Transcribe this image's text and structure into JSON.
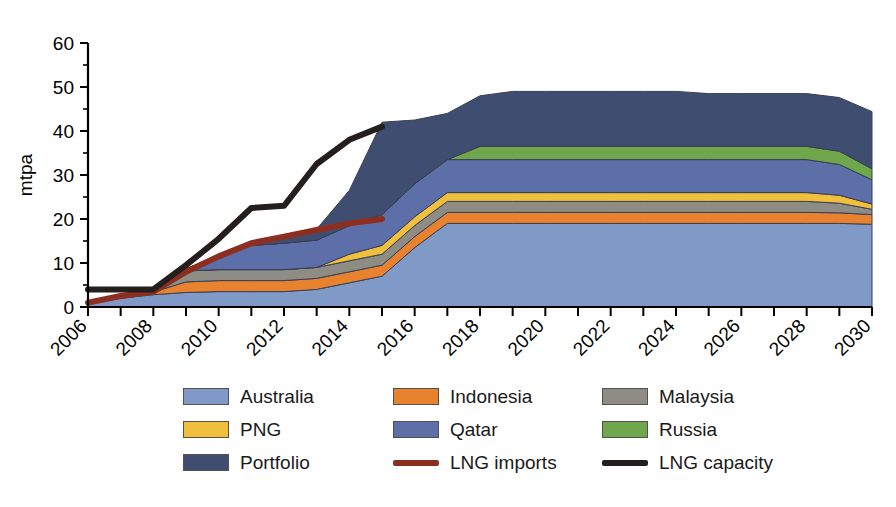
{
  "chart_data": {
    "type": "area",
    "title": "",
    "subtitle": "",
    "xlabel": "",
    "ylabel": "mtpa",
    "ylim": [
      0,
      60
    ],
    "xlim": [
      2006,
      2030
    ],
    "ytick_step": 10,
    "yticks": [
      "0",
      "10",
      "20",
      "30",
      "40",
      "50",
      "60"
    ],
    "xticks": [
      "2006",
      "2008",
      "2010",
      "2012",
      "2014",
      "2016",
      "2018",
      "2020",
      "2022",
      "2024",
      "2026",
      "2028",
      "2030"
    ],
    "xtick_step": 2,
    "minor_xticks_every": 1,
    "grid": false,
    "legend_position": "bottom",
    "stacked": true,
    "x": [
      2006,
      2007,
      2008,
      2009,
      2010,
      2011,
      2012,
      2013,
      2014,
      2015,
      2016,
      2017,
      2018,
      2019,
      2020,
      2021,
      2022,
      2023,
      2024,
      2025,
      2026,
      2027,
      2028,
      2029,
      2030
    ],
    "series": [
      {
        "name": "Australia",
        "color": "#7f9ac6",
        "type": "area",
        "values": [
          1.0,
          2.0,
          2.8,
          3.3,
          3.5,
          3.5,
          3.5,
          4.0,
          5.5,
          7.0,
          13.5,
          19.0,
          19.0,
          19.0,
          19.0,
          19.0,
          19.0,
          19.0,
          19.0,
          19.0,
          19.0,
          19.0,
          19.0,
          19.0,
          18.8
        ]
      },
      {
        "name": "Indonesia",
        "color": "#e8822f",
        "type": "area",
        "values": [
          0.0,
          0.3,
          0.6,
          2.4,
          2.5,
          2.5,
          2.5,
          2.5,
          2.5,
          2.5,
          2.5,
          2.5,
          2.5,
          2.5,
          2.5,
          2.5,
          2.5,
          2.5,
          2.5,
          2.5,
          2.5,
          2.5,
          2.5,
          2.4,
          2.2
        ]
      },
      {
        "name": "Malaysia",
        "color": "#8d8c85",
        "type": "area",
        "values": [
          0.0,
          0.0,
          0.3,
          2.5,
          2.5,
          2.5,
          2.5,
          2.5,
          2.5,
          2.5,
          2.5,
          2.5,
          2.5,
          2.5,
          2.5,
          2.5,
          2.5,
          2.5,
          2.5,
          2.5,
          2.5,
          2.5,
          2.5,
          2.2,
          1.2
        ]
      },
      {
        "name": "PNG",
        "color": "#f0c03d",
        "type": "area",
        "values": [
          0.0,
          0.0,
          0.0,
          0.0,
          0.0,
          0.0,
          0.0,
          0.0,
          1.5,
          2.0,
          2.0,
          2.0,
          2.0,
          2.0,
          2.0,
          2.0,
          2.0,
          2.0,
          2.0,
          2.0,
          2.0,
          2.0,
          2.0,
          1.8,
          1.2
        ]
      },
      {
        "name": "Qatar",
        "color": "#5c6fa8",
        "type": "area",
        "values": [
          0.0,
          0.0,
          0.0,
          0.5,
          3.0,
          5.5,
          6.0,
          6.2,
          6.5,
          7.0,
          7.5,
          7.5,
          7.5,
          7.5,
          7.5,
          7.5,
          7.5,
          7.5,
          7.5,
          7.5,
          7.5,
          7.5,
          7.5,
          7.0,
          5.5
        ]
      },
      {
        "name": "Russia",
        "color": "#6fa84c",
        "type": "area",
        "values": [
          0.0,
          0.0,
          0.0,
          0.0,
          0.0,
          0.0,
          0.0,
          0.0,
          0.0,
          0.0,
          0.0,
          0.0,
          3.0,
          3.0,
          3.0,
          3.0,
          3.0,
          3.0,
          3.0,
          3.0,
          3.0,
          3.0,
          3.0,
          3.0,
          2.5
        ]
      },
      {
        "name": "Portfolio",
        "color": "#3f4e70",
        "type": "area",
        "values": [
          0.0,
          0.0,
          0.0,
          0.0,
          0.0,
          0.5,
          1.5,
          2.5,
          8.0,
          21.0,
          14.5,
          10.5,
          11.5,
          12.5,
          12.5,
          12.5,
          12.5,
          12.5,
          12.5,
          12.0,
          12.0,
          12.0,
          12.0,
          12.2,
          13.0
        ]
      }
    ],
    "lines": [
      {
        "name": "LNG imports",
        "color": "#8c2f21",
        "type": "line",
        "x": [
          2006,
          2007,
          2008,
          2009,
          2010,
          2011,
          2012,
          2013,
          2014,
          2015
        ],
        "values": [
          1.0,
          2.5,
          3.5,
          8.0,
          11.5,
          14.5,
          16.0,
          17.5,
          19.0,
          20.0
        ]
      },
      {
        "name": "LNG capacity",
        "color": "#241f1c",
        "type": "line",
        "x": [
          2006,
          2007,
          2008,
          2009,
          2010,
          2011,
          2012,
          2013,
          2014,
          2015
        ],
        "values": [
          4.0,
          4.0,
          4.0,
          9.5,
          15.5,
          22.5,
          23.0,
          32.5,
          38.0,
          41.0
        ]
      }
    ]
  },
  "legend": {
    "entries": [
      {
        "label": "Australia",
        "color": "#7f9ac6",
        "marker": "swatch"
      },
      {
        "label": "Indonesia",
        "color": "#e8822f",
        "marker": "swatch"
      },
      {
        "label": "Malaysia",
        "color": "#8d8c85",
        "marker": "swatch"
      },
      {
        "label": "PNG",
        "color": "#f0c03d",
        "marker": "swatch"
      },
      {
        "label": "Qatar",
        "color": "#5c6fa8",
        "marker": "swatch"
      },
      {
        "label": "Russia",
        "color": "#6fa84c",
        "marker": "swatch"
      },
      {
        "label": "Portfolio",
        "color": "#3f4e70",
        "marker": "swatch"
      },
      {
        "label": "LNG imports",
        "color": "#8c2f21",
        "marker": "line"
      },
      {
        "label": "LNG capacity",
        "color": "#241f1c",
        "marker": "line"
      }
    ]
  }
}
